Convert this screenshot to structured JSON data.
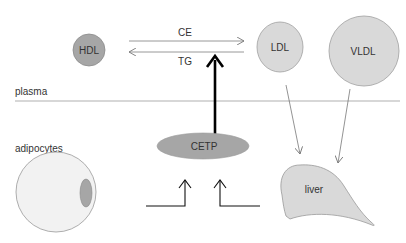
{
  "diagram": {
    "compartments": {
      "plasma": "plasma",
      "adipocytes": "adipocytes"
    },
    "particles": {
      "hdl": {
        "label": "HDL",
        "color": "#a6a6a6"
      },
      "ldl": {
        "label": "LDL",
        "color": "#d9d9d9"
      },
      "vldl": {
        "label": "VLDL",
        "color": "#d9d9d9"
      }
    },
    "enzyme": {
      "label": "CETP",
      "color": "#a6a6a6"
    },
    "organ": {
      "label": "liver",
      "color": "#d9d9d9"
    },
    "exchange": {
      "to_right": "CE",
      "to_left": "TG"
    },
    "colors": {
      "line": "#8c8c8c",
      "arrow_bold": "#000000",
      "adipocyte_fill": "#f2f2f2",
      "adipocyte_nucleus": "#a6a6a6"
    }
  }
}
